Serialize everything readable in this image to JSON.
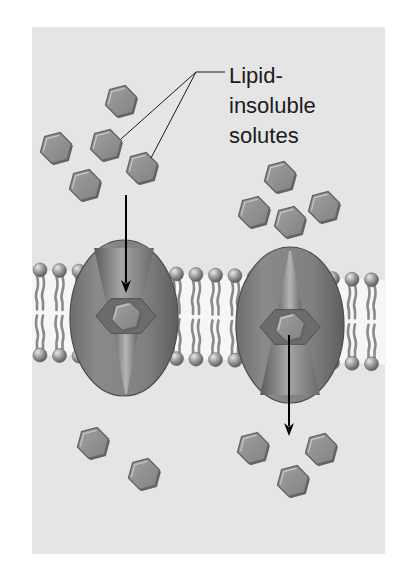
{
  "figure": {
    "panel": {
      "x": 32,
      "y": 27,
      "width": 353,
      "height": 527,
      "color": "#e5e5e5"
    },
    "label": {
      "lines": [
        "Lipid-",
        "insoluble",
        "solutes"
      ],
      "x": 229,
      "baselines": [
        83,
        113,
        143
      ],
      "leader": {
        "hub": [
          196,
          72
        ],
        "tail_end": [
          225,
          72
        ],
        "targets": [
          [
            121,
            139
          ],
          [
            151,
            158
          ]
        ]
      }
    },
    "colors": {
      "solute_fill": "#8e8e8e",
      "solute_rim": "#646464",
      "solute_highlight": "#c8c8c8",
      "protein_fill": "#7f7f7f",
      "protein_dark": "#5c5c5c",
      "protein_light": "#a8a8a8",
      "lipid_head": "#9a9a9a",
      "lipid_tail": "#8a8a8a",
      "membrane_core": "#f6f6f6",
      "arrow": "#000000"
    },
    "solutes": {
      "extracellular": [
        [
          121,
          101
        ],
        [
          56,
          148
        ],
        [
          106,
          145
        ],
        [
          142,
          168
        ],
        [
          85,
          185
        ],
        [
          280,
          177
        ],
        [
          254,
          212
        ],
        [
          290,
          222
        ],
        [
          324,
          207
        ]
      ],
      "intracellular": [
        [
          93,
          443
        ],
        [
          144,
          474
        ],
        [
          253,
          448
        ],
        [
          321,
          449
        ],
        [
          293,
          481
        ]
      ],
      "in_channel": [
        [
          126,
          316
        ],
        [
          290,
          327
        ]
      ]
    },
    "proteins": [
      {
        "name": "channel-left",
        "cx": 124,
        "cy": 318,
        "rx": 54,
        "ry": 78,
        "pore": "open-top"
      },
      {
        "name": "channel-right",
        "cx": 290,
        "cy": 325,
        "rx": 54,
        "ry": 78,
        "pore": "open-bottom"
      }
    ],
    "membrane": {
      "top_head_y_left": 270,
      "top_head_y_right": 280,
      "bottom_head_y_left": 355,
      "bottom_head_y_right": 364,
      "head_radius": 7,
      "head_spacing": 19.5,
      "x_start": 40,
      "x_end": 378
    },
    "arrows": [
      {
        "name": "arrow-into-channel",
        "from": [
          126,
          195
        ],
        "to": [
          126,
          293
        ]
      },
      {
        "name": "arrow-out-of-channel",
        "from": [
          289,
          335
        ],
        "to": [
          289,
          436
        ]
      }
    ]
  }
}
